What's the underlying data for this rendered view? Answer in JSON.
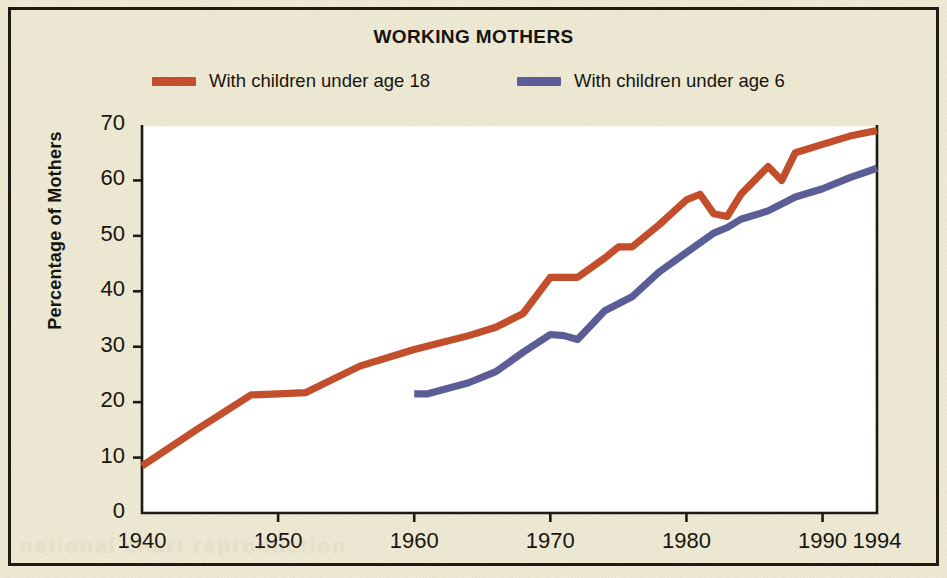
{
  "figure": {
    "title": "WORKING MOTHERS",
    "background_color": "#ece6cd",
    "border_color": "#1d1b16"
  },
  "legend": {
    "position": "top",
    "items": [
      {
        "label": "With children under age 18",
        "color": "#c24e2b",
        "icon": "line-swatch-red"
      },
      {
        "label": "With children under age 6",
        "color": "#5b5e96",
        "icon": "line-swatch-blue"
      }
    ]
  },
  "axes": {
    "y_title": "Percentage of Mothers",
    "y_ticks": [
      "0",
      "10",
      "20",
      "30",
      "40",
      "50",
      "60",
      "70"
    ],
    "x_ticks": [
      "1940",
      "1950",
      "1960",
      "1970",
      "1980",
      "1990",
      "1994"
    ]
  },
  "chart_data": {
    "type": "line",
    "title": "WORKING MOTHERS",
    "xlabel": "",
    "ylabel": "Percentage of Mothers",
    "xlim": [
      1940,
      1994
    ],
    "ylim": [
      0,
      70
    ],
    "grid": false,
    "legend_position": "top",
    "x_tick_values": [
      1940,
      1950,
      1960,
      1970,
      1980,
      1990,
      1994
    ],
    "y_tick_values": [
      0,
      10,
      20,
      30,
      40,
      50,
      60,
      70
    ],
    "series": [
      {
        "name": "With children under age 18",
        "color": "#c24e2b",
        "x": [
          1940,
          1944,
          1948,
          1950,
          1952,
          1956,
          1960,
          1964,
          1966,
          1968,
          1970,
          1971,
          1972,
          1974,
          1975,
          1976,
          1978,
          1980,
          1981,
          1982,
          1983,
          1984,
          1986,
          1987,
          1988,
          1990,
          1992,
          1994
        ],
        "values": [
          8.5,
          15.0,
          21.3,
          21.5,
          21.7,
          26.5,
          29.5,
          32.0,
          33.5,
          36.0,
          42.5,
          42.5,
          42.5,
          46.0,
          48.0,
          48.0,
          52.0,
          56.5,
          57.5,
          54.0,
          53.5,
          57.5,
          62.5,
          60.0,
          65.0,
          66.5,
          68.0,
          69.0
        ]
      },
      {
        "name": "With children under age 6",
        "color": "#5b5e96",
        "x": [
          1960,
          1961,
          1964,
          1966,
          1968,
          1970,
          1971,
          1972,
          1974,
          1976,
          1978,
          1980,
          1982,
          1983,
          1984,
          1986,
          1988,
          1990,
          1992,
          1994
        ],
        "values": [
          21.5,
          21.5,
          23.5,
          25.5,
          29.0,
          32.2,
          32.0,
          31.3,
          36.5,
          39.0,
          43.5,
          47.0,
          50.5,
          51.5,
          53.0,
          54.5,
          57.0,
          58.5,
          60.5,
          62.2
        ]
      }
    ]
  },
  "ghost_text": "national chart reproduction"
}
